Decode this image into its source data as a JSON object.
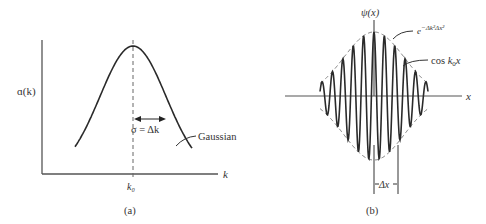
{
  "panel_a": {
    "caption": "(a)",
    "y_label": "ɑ(k)",
    "x_label": "k",
    "center_tick": "k₀",
    "width_label": "σ = Δk",
    "curve_label": "Gaussian"
  },
  "panel_b": {
    "caption": "(b)",
    "y_label": "ψ(x)",
    "x_label": "x",
    "envelope_label": "e^(−Δk²Δx²)",
    "carrier_label": "cos k₀x",
    "width_label": "Δx"
  },
  "colors": {
    "curve": "#2a2a2a",
    "axis": "#555555",
    "dashed": "#666666"
  },
  "chart_data": [
    {
      "type": "line",
      "title": "(a) Gaussian momentum distribution",
      "xlabel": "k",
      "ylabel": "A(k)",
      "x_ticks": [
        "k0"
      ],
      "annotations": [
        "sigma = Δk",
        "Gaussian"
      ],
      "grid": false,
      "series": [
        {
          "name": "Gaussian",
          "center": "k0",
          "sigma": "Δk"
        }
      ]
    },
    {
      "type": "line",
      "title": "(b) Wave packet",
      "xlabel": "x",
      "ylabel": "psi(x)",
      "annotations": [
        "e^(-Δk^2 Δx^2)",
        "cos k0 x",
        "Δx"
      ],
      "grid": false,
      "series": [
        {
          "name": "envelope",
          "formula": "exp(-Δk^2 x^2)",
          "style": "dashed"
        },
        {
          "name": "cos k0 x",
          "formula": "cos(k0 x) * envelope",
          "style": "solid"
        }
      ]
    }
  ]
}
